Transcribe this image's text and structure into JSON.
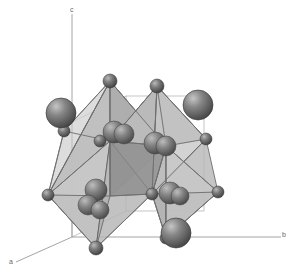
{
  "figure": {
    "background_color": "#ffffff",
    "width": 295,
    "height": 280,
    "render_style": "ball-and-stick with translucent coordination polyhedra"
  },
  "axes": {
    "origin": {
      "x": 72,
      "y": 237
    },
    "items": [
      {
        "name": "c",
        "label": "c",
        "direction": "up",
        "tip": {
          "x": 72,
          "y": 14
        },
        "label_pos": {
          "x": 70,
          "y": 6
        }
      },
      {
        "name": "b",
        "label": "b",
        "direction": "right",
        "tip": {
          "x": 281,
          "y": 237
        },
        "label_pos": {
          "x": 282,
          "y": 231
        }
      },
      {
        "name": "a",
        "label": "a",
        "direction": "down-left",
        "tip": {
          "x": 16,
          "y": 262
        },
        "label_pos": {
          "x": 9,
          "y": 258
        }
      }
    ],
    "line_color": "#9a9a9a",
    "line_width": 0.8
  },
  "colors": {
    "anion_sphere": "#6b6b6b",
    "anion_sphere_dark": "#4a4a4a",
    "cation_sphere": "#707070",
    "cation_sphere_dark": "#4e4e4e",
    "polyhedron_light": "#c9c9c9",
    "polyhedron_mid": "#b0b0b0",
    "polyhedron_dark": "#8f8f8f",
    "polyhedron_edge": "#5e5e5e",
    "bond": "#6f6f6f",
    "cell_edge": "#8d8d8d",
    "highlight": "#d8d8d8"
  },
  "legend": {
    "large_sphere_role": "A-site cation",
    "medium_sphere_role": "B-site / interstitial cation",
    "small_sphere_role": "anion (octahedron vertex)",
    "polyhedron_role": "corner-sharing octahedron"
  },
  "polyhedra": [
    {
      "name": "octahedron-upper-left",
      "center": {
        "x": 110,
        "y": 140
      },
      "shade": "light"
    },
    {
      "name": "octahedron-upper-right",
      "center": {
        "x": 160,
        "y": 142
      },
      "shade": "mid"
    },
    {
      "name": "octahedron-lower-left",
      "center": {
        "x": 110,
        "y": 196
      },
      "shade": "light"
    },
    {
      "name": "octahedron-lower-right",
      "center": {
        "x": 160,
        "y": 196
      },
      "shade": "mid"
    }
  ],
  "atoms": {
    "large_cations": [
      {
        "name": "cation-upper-left",
        "cx": 61,
        "cy": 113,
        "r": 15
      },
      {
        "name": "cation-upper-right",
        "cx": 198,
        "cy": 105,
        "r": 15
      },
      {
        "name": "cation-bottom",
        "cx": 176,
        "cy": 233,
        "r": 15
      }
    ],
    "vertex_anions": [
      {
        "name": "anion-top-left-apex",
        "cx": 110,
        "cy": 81,
        "r": 7
      },
      {
        "name": "anion-top-right-apex",
        "cx": 157,
        "cy": 86,
        "r": 7
      },
      {
        "name": "anion-left-equator",
        "cx": 48,
        "cy": 195,
        "r": 6
      },
      {
        "name": "anion-right-equator",
        "cx": 206,
        "cy": 139,
        "r": 6
      },
      {
        "name": "anion-right-lower",
        "cx": 218,
        "cy": 192,
        "r": 6
      },
      {
        "name": "anion-bottom-apex",
        "cx": 96,
        "cy": 248,
        "r": 7
      },
      {
        "name": "anion-bottom-right",
        "cx": 166,
        "cy": 238,
        "r": 6
      },
      {
        "name": "anion-mid-left",
        "cx": 64,
        "cy": 131,
        "r": 6
      },
      {
        "name": "anion-center-left",
        "cx": 100,
        "cy": 141,
        "r": 6
      },
      {
        "name": "anion-center-right",
        "cx": 152,
        "cy": 194,
        "r": 6
      }
    ],
    "interior_cations": [
      {
        "name": "interior-cation-upper-a",
        "cx": 114,
        "cy": 132,
        "r": 11
      },
      {
        "name": "interior-cation-upper-b",
        "cx": 124,
        "cy": 134,
        "r": 10
      },
      {
        "name": "interior-cation-mid-a",
        "cx": 155,
        "cy": 143,
        "r": 11
      },
      {
        "name": "interior-cation-mid-b",
        "cx": 166,
        "cy": 146,
        "r": 10
      },
      {
        "name": "interior-cation-low-a",
        "cx": 96,
        "cy": 190,
        "r": 11
      },
      {
        "name": "interior-cation-low-b",
        "cx": 88,
        "cy": 205,
        "r": 10
      },
      {
        "name": "interior-cation-low-c",
        "cx": 100,
        "cy": 210,
        "r": 9
      },
      {
        "name": "interior-cation-rlow-a",
        "cx": 170,
        "cy": 193,
        "r": 11
      },
      {
        "name": "interior-cation-rlow-b",
        "cx": 180,
        "cy": 196,
        "r": 9
      }
    ]
  }
}
